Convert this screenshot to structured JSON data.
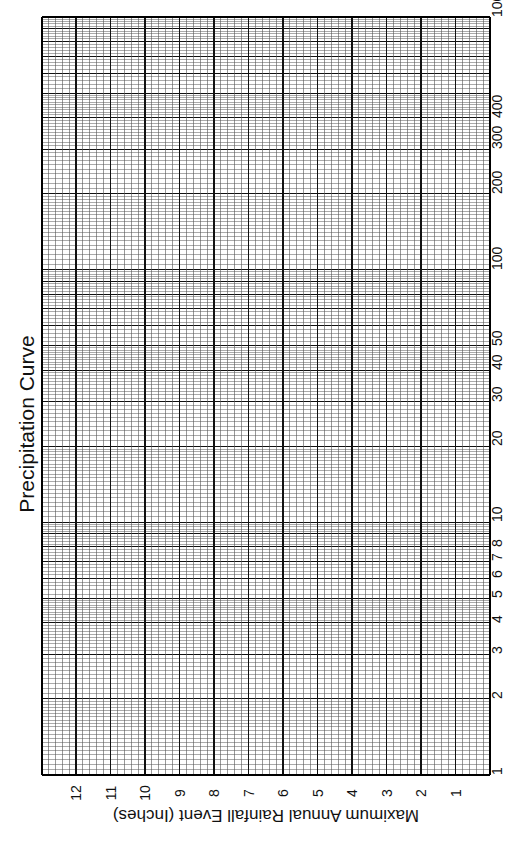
{
  "chart_data": {
    "type": "line",
    "title": "Precipitation Curve",
    "xlabel": "",
    "ylabel": "Maximum Annual Rainfall Event (Inches)",
    "x_scale": "log",
    "xlim": [
      1,
      1000
    ],
    "x_ticks": [
      1,
      2,
      3,
      4,
      5,
      6,
      7,
      8,
      10,
      20,
      30,
      40,
      50,
      100,
      200,
      300,
      400,
      1000
    ],
    "y_scale": "linear",
    "ylim": [
      0,
      12
    ],
    "y_ticks": [
      1,
      2,
      3,
      4,
      5,
      6,
      7,
      8,
      9,
      10,
      11,
      12
    ],
    "series": [],
    "grid": true,
    "orientation": "rotated 90 degrees clockwise (blank graph paper template)",
    "legend": null
  },
  "labels": {
    "title": "Precipitation Curve",
    "ylabel": "Maximum Annual Rainfall Event (Inches)",
    "x_tick_labels": [
      "1",
      "2",
      "3",
      "4",
      "5",
      "6",
      "7",
      "8",
      "10",
      "20",
      "30",
      "40",
      "50",
      "100",
      "200",
      "300",
      "400",
      "1000"
    ],
    "y_tick_labels": [
      "12",
      "11",
      "10",
      "9",
      "8",
      "7",
      "6",
      "5",
      "4",
      "3",
      "2",
      "1"
    ]
  },
  "colors": {
    "grid_major": "#111111",
    "grid_minor": "#555555",
    "background": "#ffffff"
  }
}
